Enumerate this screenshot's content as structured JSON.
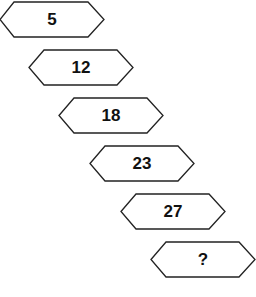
{
  "diagram": {
    "type": "number-sequence-puzzle",
    "stroke_color": "#222222",
    "fill_color": "#ffffff",
    "shapes": [
      {
        "label": "5",
        "x": -1,
        "y": 1
      },
      {
        "label": "12",
        "x": 28,
        "y": 49
      },
      {
        "label": "18",
        "x": 58,
        "y": 97
      },
      {
        "label": "23",
        "x": 89,
        "y": 145
      },
      {
        "label": "27",
        "x": 120,
        "y": 193
      },
      {
        "label": "?",
        "x": 150,
        "y": 241
      }
    ]
  }
}
